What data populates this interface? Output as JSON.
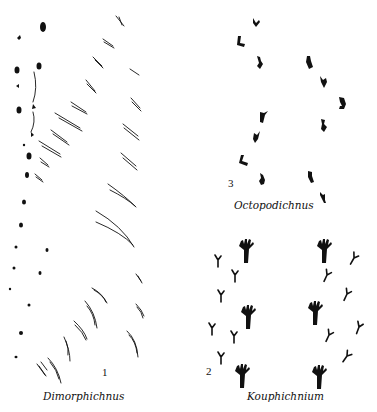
{
  "figure": {
    "panels": [
      {
        "id": "1",
        "number": "1",
        "name": "Dimorphichnus"
      },
      {
        "id": "2",
        "number": "2",
        "name": "Kouphichnium"
      },
      {
        "id": "3",
        "number": "3",
        "name": "Octopodichnus"
      }
    ],
    "colors": {
      "ink": "#111111",
      "background": "#ffffff"
    }
  }
}
